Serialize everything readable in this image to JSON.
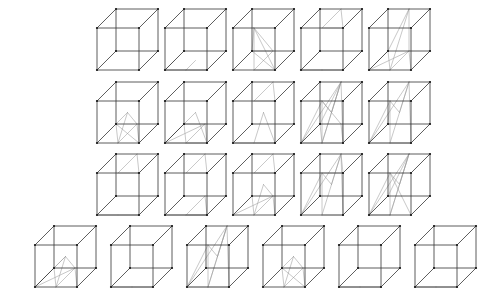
{
  "figure": {
    "background_color": "#ffffff",
    "edge_color": "#333333",
    "inner_line_color": "#9a9a9a",
    "vertex_color": "#1a1a1a",
    "width": 488,
    "height": 307,
    "rows": 4,
    "total_cubes": 21,
    "projection": {
      "front_face_size": 42,
      "depth_dx": 19,
      "depth_dy": -19
    },
    "row_counts": [
      5,
      5,
      5,
      6
    ],
    "cubes": [
      {
        "id": "cube-r1c1",
        "row": 1,
        "col": 1,
        "x": 97,
        "y": 28,
        "size": 42,
        "inner": []
      },
      {
        "id": "cube-r1c2",
        "row": 1,
        "col": 2,
        "x": 165,
        "y": 28,
        "size": 42,
        "inner": [
          [
            0,
            0,
            1,
            1
          ],
          [
            1,
            0,
            0,
            1
          ],
          [
            0,
            0,
            1,
            0
          ],
          [
            0,
            1,
            1,
            1
          ],
          [
            0,
            0,
            4,
            0
          ],
          [
            1,
            0,
            5,
            0
          ]
        ]
      },
      {
        "id": "cube-r1c3",
        "row": 1,
        "col": 3,
        "x": 233,
        "y": 28,
        "size": 42,
        "inner": [
          [
            3,
            2,
            0,
            1
          ],
          [
            3,
            2,
            1,
            1
          ],
          [
            3,
            2,
            5,
            4
          ],
          [
            0,
            1,
            5,
            4
          ],
          [
            1,
            1,
            4,
            4
          ],
          [
            3,
            2,
            4,
            4
          ],
          [
            0,
            1,
            1,
            1
          ],
          [
            4,
            4,
            5,
            4
          ]
        ]
      },
      {
        "id": "cube-r1c4",
        "row": 1,
        "col": 4,
        "x": 301,
        "y": 28,
        "size": 42,
        "inner": [
          [
            0,
            0,
            1,
            1
          ],
          [
            1,
            0,
            0,
            1
          ],
          [
            0,
            0,
            1,
            0
          ],
          [
            7,
            6,
            3,
            2
          ],
          [
            7,
            6,
            2,
            2
          ],
          [
            3,
            2,
            2,
            2
          ],
          [
            0,
            1,
            1,
            1
          ]
        ]
      },
      {
        "id": "cube-r1c5",
        "row": 1,
        "col": 5,
        "x": 369,
        "y": 28,
        "size": 42,
        "inner": [
          [
            0,
            1,
            5,
            4
          ],
          [
            0,
            1,
            4,
            4
          ],
          [
            0,
            1,
            7,
            6
          ],
          [
            5,
            4,
            7,
            6
          ],
          [
            0,
            0,
            0,
            1
          ],
          [
            0,
            0,
            5,
            4
          ],
          [
            0,
            0,
            4,
            4
          ],
          [
            4,
            4,
            7,
            6
          ],
          [
            1,
            1,
            5,
            4
          ]
        ]
      },
      {
        "id": "cube-r2c1",
        "row": 2,
        "col": 1,
        "x": 97,
        "y": 101,
        "size": 42,
        "inner": [
          [
            0,
            1,
            5,
            4
          ],
          [
            0,
            1,
            4,
            4
          ],
          [
            3,
            5,
            5,
            4
          ],
          [
            3,
            5,
            4,
            4
          ],
          [
            0,
            1,
            3,
            5
          ],
          [
            1,
            1,
            5,
            4
          ],
          [
            1,
            1,
            4,
            4
          ]
        ]
      },
      {
        "id": "cube-r2c2",
        "row": 2,
        "col": 2,
        "x": 165,
        "y": 101,
        "size": 42,
        "inner": [
          [
            0,
            1,
            5,
            4
          ],
          [
            0,
            0,
            5,
            4
          ],
          [
            0,
            0,
            4,
            4
          ],
          [
            0,
            0,
            1,
            1
          ],
          [
            1,
            1,
            5,
            4
          ],
          [
            0,
            1,
            1,
            1
          ],
          [
            3,
            5,
            0,
            0
          ],
          [
            3,
            5,
            1,
            1
          ],
          [
            4,
            4,
            5,
            4
          ],
          [
            0,
            1,
            4,
            4
          ]
        ]
      },
      {
        "id": "cube-r2c3",
        "row": 2,
        "col": 3,
        "x": 233,
        "y": 101,
        "size": 42,
        "inner": [
          [
            0,
            0,
            0,
            1
          ],
          [
            0,
            0,
            1,
            1
          ],
          [
            0,
            1,
            1,
            1
          ],
          [
            7,
            6,
            3,
            2
          ],
          [
            7,
            6,
            2,
            2
          ],
          [
            3,
            2,
            2,
            2
          ],
          [
            3,
            5,
            1,
            1
          ],
          [
            3,
            5,
            1,
            0
          ]
        ]
      },
      {
        "id": "cube-r2c4",
        "row": 2,
        "col": 4,
        "x": 301,
        "y": 101,
        "size": 42,
        "inner": [
          [
            0,
            0,
            7,
            6
          ],
          [
            0,
            0,
            3,
            2
          ],
          [
            0,
            1,
            7,
            6
          ],
          [
            0,
            1,
            3,
            2
          ],
          [
            1,
            1,
            7,
            6
          ],
          [
            1,
            0,
            7,
            6
          ],
          [
            3,
            5,
            7,
            6
          ],
          [
            3,
            5,
            3,
            2
          ],
          [
            0,
            0,
            1,
            1
          ],
          [
            1,
            0,
            0,
            1
          ],
          [
            4,
            4,
            7,
            6
          ],
          [
            5,
            4,
            3,
            2
          ],
          [
            0,
            1,
            4,
            4
          ],
          [
            1,
            1,
            5,
            4
          ]
        ]
      },
      {
        "id": "cube-r2c5",
        "row": 2,
        "col": 5,
        "x": 369,
        "y": 101,
        "size": 42,
        "inner": [
          [
            0,
            0,
            7,
            6
          ],
          [
            0,
            1,
            7,
            6
          ],
          [
            1,
            1,
            7,
            6
          ],
          [
            0,
            0,
            3,
            2
          ],
          [
            0,
            1,
            3,
            2
          ],
          [
            3,
            5,
            7,
            6
          ],
          [
            3,
            5,
            3,
            2
          ],
          [
            0,
            0,
            0,
            1
          ],
          [
            1,
            0,
            1,
            1
          ],
          [
            0,
            1,
            1,
            1
          ],
          [
            4,
            4,
            3,
            2
          ]
        ]
      },
      {
        "id": "cube-r3c1",
        "row": 3,
        "col": 1,
        "x": 97,
        "y": 173,
        "size": 42,
        "inner": [
          [
            7,
            6,
            2,
            2
          ],
          [
            7,
            6,
            3,
            2
          ],
          [
            3,
            2,
            2,
            2
          ],
          [
            0,
            1,
            0,
            0
          ],
          [
            0,
            1,
            1,
            1
          ],
          [
            0,
            0,
            1,
            1
          ]
        ]
      },
      {
        "id": "cube-r3c2",
        "row": 3,
        "col": 2,
        "x": 165,
        "y": 173,
        "size": 42,
        "inner": [
          [
            7,
            6,
            2,
            2
          ],
          [
            7,
            6,
            3,
            2
          ],
          [
            3,
            2,
            2,
            2
          ],
          [
            0,
            0,
            0,
            1
          ],
          [
            0,
            0,
            1,
            1
          ],
          [
            0,
            1,
            1,
            1
          ],
          [
            1,
            0,
            1,
            1
          ],
          [
            5,
            4,
            0,
            1
          ],
          [
            5,
            4,
            1,
            1
          ]
        ]
      },
      {
        "id": "cube-r3c3",
        "row": 3,
        "col": 3,
        "x": 233,
        "y": 173,
        "size": 42,
        "inner": [
          [
            7,
            6,
            2,
            2
          ],
          [
            7,
            6,
            3,
            2
          ],
          [
            3,
            2,
            2,
            2
          ],
          [
            0,
            1,
            5,
            4
          ],
          [
            0,
            1,
            4,
            4
          ],
          [
            1,
            1,
            5,
            4
          ],
          [
            0,
            0,
            5,
            4
          ],
          [
            3,
            5,
            5,
            4
          ],
          [
            0,
            1,
            3,
            5
          ]
        ]
      },
      {
        "id": "cube-r3c4",
        "row": 3,
        "col": 4,
        "x": 301,
        "y": 173,
        "size": 42,
        "inner": [
          [
            0,
            0,
            7,
            6
          ],
          [
            0,
            1,
            7,
            6
          ],
          [
            0,
            1,
            3,
            2
          ],
          [
            3,
            5,
            7,
            6
          ],
          [
            3,
            5,
            3,
            2
          ],
          [
            0,
            0,
            3,
            2
          ],
          [
            1,
            1,
            7,
            6
          ],
          [
            7,
            6,
            2,
            2
          ],
          [
            3,
            2,
            2,
            2
          ],
          [
            0,
            1,
            1,
            1
          ]
        ]
      },
      {
        "id": "cube-r3c5",
        "row": 3,
        "col": 5,
        "x": 369,
        "y": 173,
        "size": 42,
        "inner": [
          [
            0,
            0,
            7,
            6
          ],
          [
            0,
            1,
            7,
            6
          ],
          [
            0,
            1,
            3,
            2
          ],
          [
            3,
            5,
            7,
            6
          ],
          [
            3,
            5,
            3,
            2
          ],
          [
            0,
            0,
            3,
            2
          ],
          [
            1,
            0,
            7,
            6
          ],
          [
            1,
            1,
            3,
            2
          ],
          [
            0,
            0,
            0,
            1
          ],
          [
            4,
            4,
            7,
            6
          ]
        ]
      },
      {
        "id": "cube-r4c1",
        "row": 4,
        "col": 1,
        "x": 35,
        "y": 245,
        "size": 42,
        "inner": [
          [
            0,
            0,
            5,
            4
          ],
          [
            0,
            0,
            4,
            4
          ],
          [
            0,
            1,
            5,
            4
          ],
          [
            0,
            1,
            4,
            4
          ],
          [
            1,
            1,
            5,
            4
          ],
          [
            3,
            5,
            5,
            4
          ],
          [
            3,
            5,
            4,
            4
          ],
          [
            0,
            0,
            3,
            5
          ],
          [
            0,
            1,
            3,
            5
          ]
        ]
      },
      {
        "id": "cube-r4c2",
        "row": 4,
        "col": 2,
        "x": 111,
        "y": 245,
        "size": 42,
        "inner": [
          [
            0,
            0,
            1,
            1
          ],
          [
            1,
            0,
            0,
            1
          ],
          [
            0,
            0,
            1,
            0
          ],
          [
            0,
            1,
            1,
            1
          ]
        ]
      },
      {
        "id": "cube-r4c3",
        "row": 4,
        "col": 3,
        "x": 187,
        "y": 245,
        "size": 42,
        "inner": [
          [
            0,
            0,
            7,
            6
          ],
          [
            0,
            1,
            7,
            6
          ],
          [
            0,
            1,
            3,
            2
          ],
          [
            3,
            5,
            7,
            6
          ],
          [
            3,
            5,
            3,
            2
          ],
          [
            0,
            0,
            3,
            2
          ],
          [
            1,
            1,
            7,
            6
          ],
          [
            0,
            0,
            0,
            1
          ],
          [
            1,
            0,
            7,
            6
          ],
          [
            0,
            1,
            1,
            1
          ]
        ]
      },
      {
        "id": "cube-r4c4",
        "row": 4,
        "col": 4,
        "x": 263,
        "y": 245,
        "size": 42,
        "inner": [
          [
            0,
            1,
            5,
            4
          ],
          [
            0,
            1,
            4,
            4
          ],
          [
            1,
            1,
            5,
            4
          ],
          [
            3,
            5,
            5,
            4
          ],
          [
            3,
            5,
            4,
            4
          ],
          [
            0,
            1,
            3,
            5
          ],
          [
            1,
            1,
            4,
            4
          ]
        ]
      },
      {
        "id": "cube-r4c5",
        "row": 4,
        "col": 5,
        "x": 339,
        "y": 245,
        "size": 42,
        "inner": [
          [
            0,
            0,
            1,
            1
          ],
          [
            1,
            0,
            0,
            1
          ],
          [
            0,
            0,
            1,
            0
          ],
          [
            0,
            1,
            1,
            1
          ]
        ]
      },
      {
        "id": "cube-r4c6",
        "row": 4,
        "col": 6,
        "x": 415,
        "y": 245,
        "size": 42,
        "inner": [
          [
            0,
            0,
            1,
            1
          ],
          [
            1,
            0,
            0,
            1
          ],
          [
            0,
            0,
            1,
            0
          ],
          [
            0,
            1,
            1,
            1
          ]
        ]
      }
    ]
  }
}
